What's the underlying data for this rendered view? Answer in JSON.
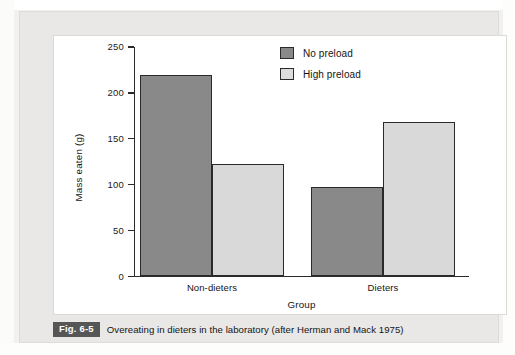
{
  "figure": {
    "badge": "Fig. 6-5",
    "caption": "Overeating in dieters in the laboratory (after Herman and Mack 1975)"
  },
  "chart_data": {
    "type": "bar",
    "title": "",
    "xlabel": "Group",
    "ylabel": "Mass eaten (g)",
    "categories": [
      "Non-dieters",
      "Dieters"
    ],
    "series": [
      {
        "name": "No preload",
        "values": [
          219,
          97
        ],
        "color": "#898989"
      },
      {
        "name": "High preload",
        "values": [
          123,
          168
        ],
        "color": "#d9d9d9"
      }
    ],
    "ylim": [
      0,
      250
    ],
    "yticks": [
      0,
      50,
      100,
      150,
      200,
      250
    ],
    "ytick_labels": [
      "0",
      "50",
      "100",
      "150",
      "200",
      "250"
    ],
    "grid": false,
    "legend_position": "top-right"
  }
}
